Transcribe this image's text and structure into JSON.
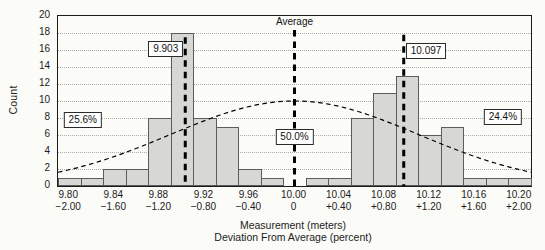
{
  "figure": {
    "background": "#fbfbf8",
    "colors": {
      "bar_fill": "#d7d7d6",
      "bar_border": "#5c5c5c",
      "gridline": "#a9a9a9",
      "axis": "#1b1b1b",
      "dashed_line": "#000000",
      "text": "#1c1c1c",
      "annotation_box_bg": "#ffffff"
    }
  },
  "chart_data": {
    "type": "bar",
    "subtype": "histogram-with-gaussian-curve",
    "title": "",
    "ylabel": "Count",
    "xlabel_line1": "Measurement (meters)",
    "xlabel_line2": "Deviation From Average (percent)",
    "ylim": [
      0,
      20
    ],
    "yticks": [
      0,
      2,
      4,
      6,
      8,
      10,
      12,
      14,
      16,
      18,
      20
    ],
    "grid": "horizontal-dotted",
    "xlim": [
      9.79,
      10.21
    ],
    "bin_width": 0.02,
    "bin_centers": [
      9.8,
      9.82,
      9.84,
      9.86,
      9.88,
      9.9,
      9.92,
      9.94,
      9.96,
      9.98,
      10.0,
      10.02,
      10.04,
      10.06,
      10.08,
      10.1,
      10.12,
      10.14,
      10.16,
      10.18,
      10.2
    ],
    "counts": [
      1,
      1,
      2,
      2,
      8,
      18,
      8,
      7,
      2,
      1,
      0,
      1,
      1,
      8,
      11,
      13,
      6,
      7,
      1,
      1,
      1
    ],
    "xticks": [
      {
        "value": 9.8,
        "meters": "9.80",
        "percent": "−2.00"
      },
      {
        "value": 9.84,
        "meters": "9.84",
        "percent": "−1.60"
      },
      {
        "value": 9.88,
        "meters": "9.88",
        "percent": "−1.20"
      },
      {
        "value": 9.92,
        "meters": "9.92",
        "percent": "−0.80"
      },
      {
        "value": 9.96,
        "meters": "9.96",
        "percent": "−0.40"
      },
      {
        "value": 10.0,
        "meters": "10.00",
        "percent": "0"
      },
      {
        "value": 10.04,
        "meters": "10.04",
        "percent": "+0.40"
      },
      {
        "value": 10.08,
        "meters": "10.08",
        "percent": "+0.80"
      },
      {
        "value": 10.12,
        "meters": "10.12",
        "percent": "+1.20"
      },
      {
        "value": 10.16,
        "meters": "10.16",
        "percent": "+1.60"
      },
      {
        "value": 10.2,
        "meters": "10.20",
        "percent": "+2.00"
      }
    ],
    "curve": {
      "shape": "gaussian",
      "style": "dashed",
      "mean": 10.0,
      "sigma": 0.11,
      "peak_count": 10
    },
    "vlines": [
      {
        "id": "mean-left-line",
        "value": 9.903,
        "top_count": 17.5,
        "width": 3
      },
      {
        "id": "average-line",
        "value": 10.0,
        "top_count": 18.35,
        "width": 3
      },
      {
        "id": "mean-right-line",
        "value": 10.097,
        "top_count": 17.8,
        "width": 3
      }
    ],
    "annotations": [
      {
        "id": "average-label",
        "text": "Average",
        "boxed": false,
        "value": 10.0,
        "count": 19.35,
        "anchor": "center"
      },
      {
        "id": "mean-left-label",
        "text": "9.903",
        "boxed": true,
        "value": 9.903,
        "count": 16.1,
        "anchor": "right"
      },
      {
        "id": "mean-right-label",
        "text": "10.097",
        "boxed": true,
        "value": 10.097,
        "count": 15.9,
        "anchor": "left"
      },
      {
        "id": "pct-left-label",
        "text": "25.6%",
        "boxed": true,
        "value": 9.812,
        "count": 7.8,
        "anchor": "center"
      },
      {
        "id": "pct-center-label",
        "text": "50.0%",
        "boxed": true,
        "value": 10.0,
        "count": 5.8,
        "anchor": "center"
      },
      {
        "id": "pct-right-label",
        "text": "24.4%",
        "boxed": true,
        "value": 10.185,
        "count": 8.1,
        "anchor": "center"
      }
    ]
  }
}
